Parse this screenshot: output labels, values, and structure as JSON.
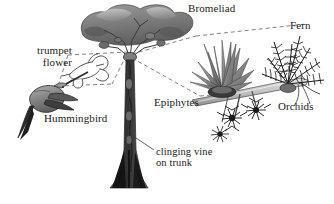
{
  "figure": {
    "background_color": "#ffffff",
    "ink_color": "#1a1a1a"
  },
  "labels": {
    "trumpet_flower": "trumpet\nflower",
    "hummingbird": "Hummingbird",
    "bromeliad": "Bromeliad",
    "fern": "Fern",
    "epiphytes": "Epiphytes",
    "orchids": "Orchids",
    "clinging_vine": "clinging vine\non trunk"
  },
  "elements": [
    {
      "name": "canopy",
      "description": "dark gray cloud-shaped tree crown"
    },
    {
      "name": "trunk",
      "description": "slender tall trunk with buttress base"
    },
    {
      "name": "vine",
      "description": "twisting vine clinging to the trunk"
    },
    {
      "name": "branch",
      "description": "enlarged detail branch angling up to the right"
    },
    {
      "name": "bromeliad-plant",
      "description": "rosette of pointed blades on branch"
    },
    {
      "name": "fern-plant",
      "description": "feathery dark fronds on branch"
    },
    {
      "name": "orchid-clusters",
      "description": "three dark spiky flower clusters hanging from branch"
    },
    {
      "name": "hummingbird",
      "description": "gray hummingbird feeding at flower"
    },
    {
      "name": "trumpet-flower-plant",
      "description": "outline trumpet-shaped flower in callout"
    },
    {
      "name": "callout-lines",
      "description": "dashed lines linking tree node to enlarged branch"
    }
  ],
  "palette": {
    "canopy_dark": "#6e6e6e",
    "canopy_light": "#b9b9b9",
    "trunk": "#4a4a4a",
    "trunk_base": "#1c1c1c",
    "branch": "#c9c9c9",
    "foliage_dark": "#2a2a2a",
    "foliage_mid": "#8c8c8c",
    "bird_body": "#8f8f8f",
    "outline": "#2b2b2b"
  }
}
